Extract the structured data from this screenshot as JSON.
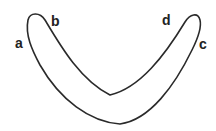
{
  "diagram": {
    "shape": "u-shaped-closed-band",
    "stroke_color": "#2a2a2a",
    "fill_color": "#ffffff",
    "labels": [
      {
        "id": "a",
        "text": "a",
        "x": 15,
        "y": 36
      },
      {
        "id": "b",
        "text": "b",
        "x": 51,
        "y": 14
      },
      {
        "id": "d",
        "text": "d",
        "x": 162,
        "y": 13
      },
      {
        "id": "c",
        "text": "c",
        "x": 199,
        "y": 37
      }
    ]
  }
}
